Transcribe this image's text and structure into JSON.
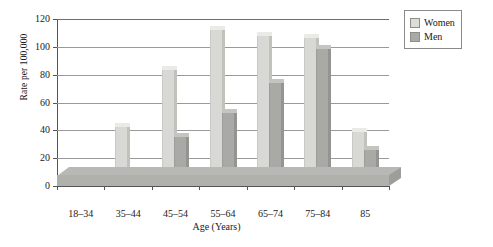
{
  "chart_data": {
    "type": "bar",
    "title": "",
    "xlabel": "Age (Years)",
    "ylabel": "Rate per 100,000",
    "categories": [
      "18–34",
      "35–44",
      "45–54",
      "55–64",
      "65–74",
      "75–84",
      "85"
    ],
    "series": [
      {
        "name": "Women",
        "values": [
          10,
          45,
          86,
          115,
          111,
          109,
          42
        ],
        "color": "#dcdcd8"
      },
      {
        "name": "Men",
        "values": [
          5,
          11,
          38,
          55,
          77,
          101,
          29
        ],
        "color": "#a9a9a5"
      }
    ],
    "ylim": [
      0,
      120
    ],
    "yticks": [
      0,
      20,
      40,
      60,
      80,
      100,
      120
    ],
    "ytick_labels": [
      "0",
      "20",
      "40",
      "60",
      "80",
      "100",
      "120"
    ],
    "grid": true,
    "grid_axis": "y",
    "legend_position": "top-right",
    "style": "3d-perspective"
  },
  "axes": {
    "y_title": "Rate per 100,000",
    "x_title": "Age (Years)"
  },
  "legend": {
    "entries": [
      {
        "label": "Women",
        "swatch": "women-swatch"
      },
      {
        "label": "Men",
        "swatch": "men-swatch"
      }
    ]
  }
}
